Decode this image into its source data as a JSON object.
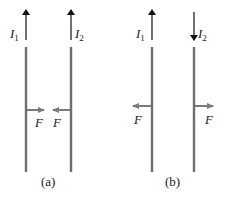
{
  "figure": {
    "panels": [
      {
        "id": "a",
        "caption": "(a)",
        "wires": [
          {
            "current_label": "I",
            "current_subscript": "1",
            "current_direction": "up"
          },
          {
            "current_label": "I",
            "current_subscript": "2",
            "current_direction": "up"
          }
        ],
        "forces": [
          {
            "label": "F",
            "direction": "right"
          },
          {
            "label": "F",
            "direction": "left"
          }
        ],
        "interaction": "attract"
      },
      {
        "id": "b",
        "caption": "(b)",
        "wires": [
          {
            "current_label": "I",
            "current_subscript": "1",
            "current_direction": "up"
          },
          {
            "current_label": "I",
            "current_subscript": "2",
            "current_direction": "down"
          }
        ],
        "forces": [
          {
            "label": "F",
            "direction": "left"
          },
          {
            "label": "F",
            "direction": "right"
          }
        ],
        "interaction": "repel"
      }
    ],
    "colors": {
      "wire": "#6e6e6e",
      "current_arrow": "#111111",
      "force_arrow": "#7a7a7a",
      "text": "#1a1a1a"
    }
  }
}
